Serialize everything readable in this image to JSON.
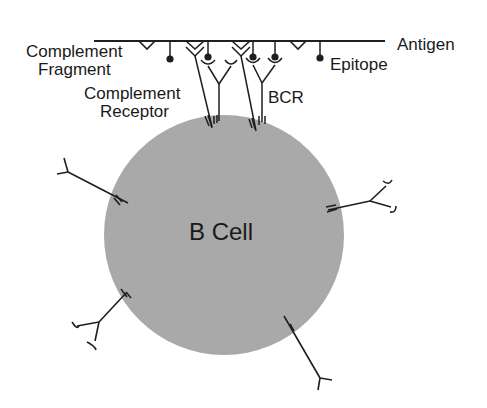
{
  "diagram": {
    "colors": {
      "background": "#ffffff",
      "cell_fill": "#a9a9a9",
      "stroke": "#1f1f1f",
      "text": "#1a1a1a"
    },
    "cell": {
      "label": "B Cell",
      "center": [
        224,
        235
      ],
      "radius": 120
    },
    "labels": {
      "antigen": "Antigen",
      "epitope": "Epitope",
      "complement_fragment_line1": "Complement",
      "complement_fragment_line2": "Fragment",
      "complement_receptor_line1": "Complement",
      "complement_receptor_line2": "Receptor",
      "bcr": "BCR"
    },
    "antigen_line": {
      "x1": 94,
      "x2": 385,
      "y": 41
    },
    "complement_fragments": [
      {
        "x": 147
      },
      {
        "x": 298
      }
    ],
    "epitopes": [
      {
        "x": 170,
        "dot_y": 60
      },
      {
        "x": 208,
        "dot_y": 57
      },
      {
        "x": 253,
        "dot_y": 57
      },
      {
        "x": 275,
        "dot_y": 57
      },
      {
        "x": 320,
        "dot_y": 58
      }
    ],
    "bound_receptors": [
      {
        "type": "complement-receptor",
        "x": 195
      },
      {
        "type": "bcr",
        "x": 219
      },
      {
        "type": "complement-receptor",
        "x": 241
      },
      {
        "type": "bcr",
        "x": 262
      }
    ],
    "free_receptors": [
      {
        "position": "left",
        "type": "complement-receptor"
      },
      {
        "position": "right",
        "type": "bcr"
      },
      {
        "position": "lower-left",
        "type": "bcr"
      },
      {
        "position": "lower-right",
        "type": "complement-receptor"
      }
    ]
  }
}
